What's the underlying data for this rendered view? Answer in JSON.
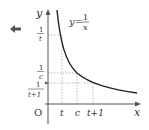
{
  "diagram": {
    "function_label": {
      "lhs": "y=",
      "num": "1",
      "den": "x"
    },
    "axes": {
      "x_label": "x",
      "y_label": "y",
      "origin_label": "O"
    },
    "x_ticks": [
      "t",
      "c",
      "t+1"
    ],
    "y_ticks": [
      {
        "num": "1",
        "den": "t"
      },
      {
        "num": "1",
        "den": "c"
      },
      {
        "num": "1",
        "den": "t+1"
      }
    ],
    "nav_arrow": "left-arrow-icon",
    "colors": {
      "curve": "#222222",
      "axis": "#555555",
      "dashed": "#888888",
      "arrow_icon": "#555555"
    }
  }
}
